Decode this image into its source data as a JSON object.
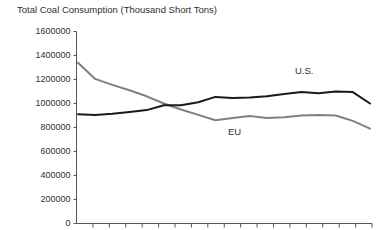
{
  "chart_data": {
    "type": "line",
    "title": "Total Coal Consumption (Thousand Short Tons)",
    "xlabel": "",
    "ylabel": "",
    "ylim": [
      0,
      1600000
    ],
    "ytick_labels": [
      "1600000",
      "1400000",
      "1200000",
      "1000000",
      "800000",
      "600000",
      "400000",
      "200000",
      "0"
    ],
    "ytick_values": [
      1600000,
      1400000,
      1200000,
      1000000,
      800000,
      600000,
      400000,
      200000,
      0
    ],
    "grid": false,
    "legend_position": "inline-annotation",
    "x_tick_count": 18,
    "x_tick_labels": [],
    "x": [
      0,
      1,
      2,
      3,
      4,
      5,
      6,
      7,
      8,
      9,
      10,
      11,
      12,
      13,
      14,
      15,
      16,
      17
    ],
    "series": [
      {
        "name": "EU",
        "color": "#808080",
        "label_x": 12,
        "values": [
          1340000,
          1205000,
          1155000,
          1110000,
          1060000,
          1000000,
          950000,
          905000,
          860000,
          880000,
          895000,
          880000,
          885000,
          900000,
          905000,
          900000,
          855000,
          790000
        ]
      },
      {
        "name": "U.S.",
        "color": "#1a1a1a",
        "label_x": 11,
        "values": [
          910000,
          905000,
          915000,
          930000,
          945000,
          985000,
          985000,
          1010000,
          1055000,
          1045000,
          1050000,
          1060000,
          1080000,
          1095000,
          1085000,
          1100000,
          1095000,
          1000000
        ]
      }
    ],
    "annotations": [
      {
        "text": "U.S.",
        "x_px": 295,
        "y_px": 66
      },
      {
        "text": "EU",
        "x_px": 228,
        "y_px": 127
      }
    ],
    "axis_color": "#555555",
    "text_color": "#2f2f2f"
  }
}
